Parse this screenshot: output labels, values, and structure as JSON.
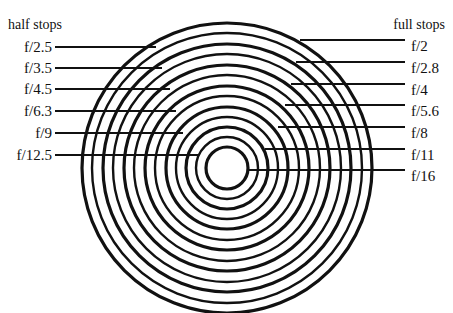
{
  "diagram": {
    "colors": {
      "line": "#111111",
      "background": "#ffffff"
    },
    "center": {
      "x": 227,
      "y": 168
    },
    "rings": [
      {
        "r": 21,
        "stop": "f/16",
        "kind": "full"
      },
      {
        "r": 31,
        "stop": "f/12.5",
        "kind": "half"
      },
      {
        "r": 41,
        "stop": "f/11",
        "kind": "full"
      },
      {
        "r": 51,
        "stop": "f/9",
        "kind": "half"
      },
      {
        "r": 61,
        "stop": "f/8",
        "kind": "full"
      },
      {
        "r": 72,
        "stop": "f/6.3",
        "kind": "half"
      },
      {
        "r": 82,
        "stop": "f/5.6",
        "kind": "full"
      },
      {
        "r": 93,
        "stop": "f/4.5",
        "kind": "half"
      },
      {
        "r": 103,
        "stop": "f/4",
        "kind": "full"
      },
      {
        "r": 114,
        "stop": "f/3.5",
        "kind": "half"
      },
      {
        "r": 124,
        "stop": "f/2.8",
        "kind": "full"
      },
      {
        "r": 135,
        "stop": "f/2.5",
        "kind": "half"
      },
      {
        "r": 145,
        "stop": "f/2",
        "kind": "full"
      }
    ],
    "half_stops": {
      "heading": "half stops",
      "items": [
        {
          "label": "f/2.5",
          "y": 47,
          "x_end": 156
        },
        {
          "label": "f/3.5",
          "y": 68,
          "x_end": 162
        },
        {
          "label": "f/4.5",
          "y": 89,
          "x_end": 170
        },
        {
          "label": "f/6.3",
          "y": 111,
          "x_end": 176
        },
        {
          "label": "f/9",
          "y": 133,
          "x_end": 183
        },
        {
          "label": "f/12.5",
          "y": 155,
          "x_end": 198
        }
      ]
    },
    "full_stops": {
      "heading": "full stops",
      "items": [
        {
          "label": "f/2",
          "y": 40,
          "x_start": 300
        },
        {
          "label": "f/2.8",
          "y": 62,
          "x_start": 296
        },
        {
          "label": "f/4",
          "y": 84,
          "x_start": 291
        },
        {
          "label": "f/5.6",
          "y": 105,
          "x_start": 285
        },
        {
          "label": "f/8",
          "y": 127,
          "x_start": 278
        },
        {
          "label": "f/11",
          "y": 149,
          "x_start": 265
        },
        {
          "label": "f/16",
          "y": 170,
          "x_start": 247
        }
      ]
    }
  }
}
